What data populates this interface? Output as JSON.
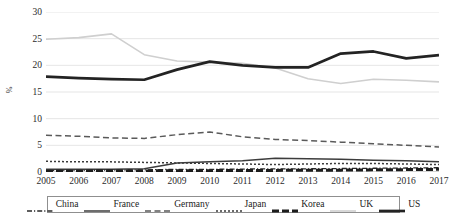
{
  "chart_data": {
    "type": "line",
    "title": "",
    "xlabel": "",
    "ylabel": "%",
    "ylim": [
      0,
      30
    ],
    "yticks": [
      0,
      5,
      10,
      15,
      20,
      25,
      30
    ],
    "grid": true,
    "legend_position": "bottom",
    "x": [
      2005,
      2006,
      2007,
      2008,
      2009,
      2010,
      2011,
      2012,
      2013,
      2014,
      2015,
      2016,
      2017
    ],
    "categories": [
      "2005",
      "2006",
      "2007",
      "2008",
      "2009",
      "2010",
      "2011",
      "2012",
      "2013",
      "2014",
      "2015",
      "2016",
      "2017"
    ],
    "series": [
      {
        "name": "China",
        "style": "dash-dot",
        "color": "#2a2a2a",
        "values": [
          0.3,
          0.3,
          0.35,
          0.4,
          0.5,
          0.5,
          0.55,
          0.6,
          0.6,
          0.65,
          0.7,
          0.75,
          0.8
        ]
      },
      {
        "name": "France",
        "style": "solid",
        "color": "#3c3c3c",
        "values": [
          0.5,
          0.5,
          0.5,
          0.6,
          1.7,
          1.9,
          2.1,
          2.6,
          2.5,
          2.4,
          2.2,
          2.1,
          1.9
        ]
      },
      {
        "name": "Germany",
        "style": "long-dash",
        "color": "#5a5a5a",
        "values": [
          6.9,
          6.7,
          6.4,
          6.3,
          7.0,
          7.5,
          6.6,
          6.1,
          5.9,
          5.6,
          5.3,
          5.0,
          4.7
        ]
      },
      {
        "name": "Japan",
        "style": "dotted",
        "color": "#3a3a3a",
        "values": [
          2.0,
          1.9,
          1.9,
          1.8,
          1.7,
          1.6,
          1.5,
          1.4,
          1.5,
          1.6,
          1.6,
          1.5,
          1.4
        ]
      },
      {
        "name": "Korea",
        "style": "thick-dash",
        "color": "#1c1c1c",
        "values": [
          0.15,
          0.15,
          0.2,
          0.2,
          0.25,
          0.25,
          0.3,
          0.3,
          0.35,
          0.35,
          0.4,
          0.45,
          0.5
        ]
      },
      {
        "name": "UK",
        "style": "solid-light",
        "color": "#cfcfcf",
        "values": [
          24.9,
          25.2,
          25.9,
          22.0,
          20.8,
          20.6,
          20.4,
          19.5,
          17.5,
          16.6,
          17.4,
          17.2,
          16.9
        ]
      },
      {
        "name": "US",
        "style": "solid-thick",
        "color": "#232323",
        "values": [
          17.9,
          17.6,
          17.4,
          17.3,
          19.2,
          20.7,
          20.0,
          19.6,
          19.6,
          22.2,
          22.6,
          21.3,
          21.9
        ]
      }
    ]
  },
  "axes": {
    "y_title": "%",
    "y_ticks": [
      "30",
      "25",
      "20",
      "15",
      "10",
      "5",
      "0"
    ],
    "x_ticks": [
      "2005",
      "2006",
      "2007",
      "2008",
      "2009",
      "2010",
      "2011",
      "2012",
      "2013",
      "2014",
      "2015",
      "2016",
      "2017"
    ]
  },
  "legend": {
    "items": [
      {
        "label": "China"
      },
      {
        "label": "France"
      },
      {
        "label": "Germany"
      },
      {
        "label": "Japan"
      },
      {
        "label": "Korea"
      },
      {
        "label": "UK"
      },
      {
        "label": "US"
      }
    ]
  }
}
